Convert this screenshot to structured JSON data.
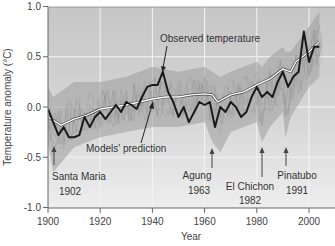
{
  "chart_data": {
    "type": "line",
    "title": "",
    "xlabel": "Year",
    "ylabel": "Temperature anomaly (°C)",
    "xlim": [
      1900,
      2010
    ],
    "ylim": [
      -1.0,
      1.0
    ],
    "x_ticks": [
      1900,
      1920,
      1940,
      1960,
      1980,
      2000
    ],
    "x_tick_labels": [
      "1900",
      "1920",
      "1940",
      "1960",
      "1980",
      "2000"
    ],
    "y_ticks": [
      1.0,
      0.5,
      0.0,
      -0.5,
      -1.0
    ],
    "y_tick_labels": [
      "1.0",
      "0.5",
      "0.0",
      "-0.5",
      "-1.0"
    ],
    "grid": true,
    "legend": "none (inline annotations)",
    "series": [
      {
        "name": "Observed temperature",
        "style": "thick black line",
        "color": "#1a1a1a",
        "x": [
          1900,
          1902,
          1904,
          1906,
          1908,
          1910,
          1912,
          1914,
          1916,
          1918,
          1920,
          1922,
          1924,
          1926,
          1928,
          1930,
          1932,
          1934,
          1936,
          1938,
          1940,
          1942,
          1944,
          1946,
          1948,
          1950,
          1952,
          1954,
          1956,
          1958,
          1960,
          1962,
          1964,
          1966,
          1968,
          1970,
          1972,
          1974,
          1976,
          1978,
          1980,
          1982,
          1984,
          1986,
          1988,
          1990,
          1992,
          1994,
          1996,
          1998,
          2000,
          2002,
          2004
        ],
        "values": [
          -0.02,
          -0.15,
          -0.28,
          -0.2,
          -0.3,
          -0.3,
          -0.28,
          -0.1,
          -0.2,
          -0.1,
          -0.05,
          -0.12,
          -0.05,
          0.02,
          -0.05,
          0.05,
          0.02,
          -0.02,
          0.1,
          0.2,
          0.22,
          0.22,
          0.35,
          0.15,
          0.05,
          -0.1,
          0.0,
          -0.15,
          -0.05,
          0.05,
          0.02,
          0.05,
          -0.2,
          0.0,
          -0.05,
          0.05,
          0.0,
          -0.1,
          -0.05,
          0.1,
          0.2,
          0.1,
          0.15,
          0.1,
          0.25,
          0.35,
          0.2,
          0.3,
          0.35,
          0.75,
          0.45,
          0.6,
          0.6
        ]
      },
      {
        "name": "Models' prediction",
        "style": "white line with dark outline (ensemble mean)",
        "color": "#ffffff",
        "x": [
          1900,
          1905,
          1910,
          1915,
          1920,
          1925,
          1930,
          1935,
          1940,
          1945,
          1950,
          1955,
          1960,
          1963,
          1965,
          1970,
          1975,
          1980,
          1985,
          1990,
          1993,
          1995,
          2000,
          2004
        ],
        "values": [
          -0.1,
          -0.18,
          -0.12,
          -0.08,
          -0.02,
          0.0,
          0.02,
          0.05,
          0.08,
          0.1,
          0.1,
          0.12,
          0.13,
          0.12,
          0.05,
          0.12,
          0.15,
          0.22,
          0.28,
          0.38,
          0.35,
          0.45,
          0.55,
          0.65
        ]
      },
      {
        "name": "Model ensemble spread",
        "style": "grey shaded band of individual model runs",
        "color": "#9a9a9a",
        "x": [
          1900,
          1902,
          1910,
          1920,
          1930,
          1940,
          1950,
          1960,
          1963,
          1966,
          1970,
          1980,
          1982,
          1985,
          1990,
          1991,
          1993,
          2000,
          2004
        ],
        "upper": [
          0.2,
          0.1,
          0.25,
          0.25,
          0.3,
          0.4,
          0.35,
          0.4,
          0.35,
          0.3,
          0.35,
          0.45,
          0.4,
          0.5,
          0.6,
          0.55,
          0.55,
          0.8,
          0.95
        ],
        "lower": [
          -0.35,
          -0.65,
          -0.4,
          -0.3,
          -0.25,
          -0.2,
          -0.2,
          -0.15,
          -0.35,
          -0.45,
          -0.25,
          -0.15,
          -0.35,
          -0.2,
          -0.05,
          -0.3,
          -0.1,
          0.2,
          0.3
        ]
      }
    ],
    "annotations": [
      {
        "text": "Observed temperature",
        "x": 1944,
        "y": 0.35,
        "type": "arrow-label"
      },
      {
        "text": "Models' prediction",
        "x": 1940,
        "y": 0.08,
        "type": "arrow-label"
      },
      {
        "text": "Santa Maria",
        "year_text": "1902",
        "x": 1902,
        "type": "volcano-arrow"
      },
      {
        "text": "Agung",
        "year_text": "1963",
        "x": 1963,
        "type": "volcano-arrow"
      },
      {
        "text": "El Chichon",
        "year_text": "1982",
        "x": 1982,
        "type": "volcano-arrow"
      },
      {
        "text": "Pinatubo",
        "year_text": "1991",
        "x": 1991,
        "type": "volcano-arrow"
      }
    ]
  },
  "labels": {
    "xlabel": "Year",
    "ylabel": "Temperature anomaly (°C)",
    "observed": "Observed temperature",
    "models": "Models' prediction",
    "santa_maria": "Santa Maria",
    "santa_maria_year": "1902",
    "agung": "Agung",
    "agung_year": "1963",
    "el_chichon": "El Chichon",
    "el_chichon_year": "1982",
    "pinatubo": "Pinatubo",
    "pinatubo_year": "1991",
    "x_ticks": [
      "1900",
      "1920",
      "1940",
      "1960",
      "1980",
      "2000"
    ],
    "y_ticks": [
      "1.0",
      "0.5",
      "0.0",
      "-0.5",
      "-1.0"
    ]
  },
  "colors": {
    "plot_bg_top": "#c9c9c9",
    "plot_bg_bottom": "#ececec",
    "grid": "#f2f2f2",
    "observed": "#1a1a1a",
    "model_mean": "#ffffff",
    "ensemble": "#9a9a9a",
    "axis": "#555555"
  }
}
